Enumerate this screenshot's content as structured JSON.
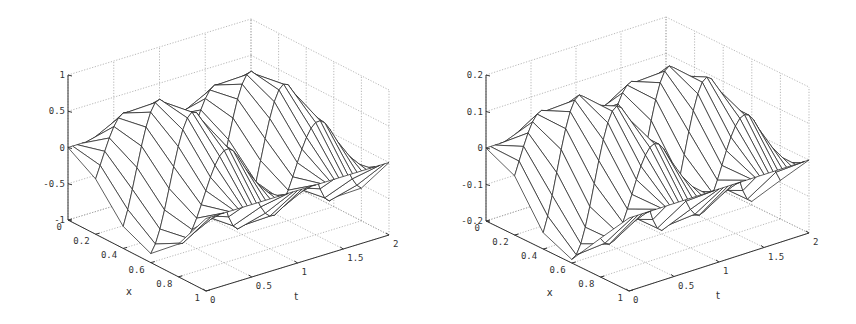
{
  "chart_data": [
    {
      "type": "surface",
      "title": "",
      "xlabel": "x",
      "ylabel": "t",
      "zlabel": "",
      "x_ticks": [
        "0",
        "0.2",
        "0.4",
        "0.6",
        "0.8",
        "1"
      ],
      "t_ticks": [
        "0",
        "0.5",
        "1",
        "1.5",
        "2"
      ],
      "z_ticks": [
        "-1",
        "-0.5",
        "0",
        "0.5",
        "1"
      ],
      "xlim": [
        0,
        1
      ],
      "tlim": [
        0,
        2
      ],
      "zlim": [
        -1,
        1
      ],
      "grid": true,
      "style": "wireframe mesh, black lines on white",
      "function_description": "wave u(x,t) with amplitude ~1, peaks ~0.75-1 and troughs ~-1 along t in [0,2], sinusoidal in x",
      "mesh": {
        "x_lines": 6,
        "t_lines": 41
      },
      "amplitude": 1.0
    },
    {
      "type": "surface",
      "title": "",
      "xlabel": "x",
      "ylabel": "t",
      "zlabel": "",
      "x_ticks": [
        "0",
        "0.2",
        "0.4",
        "0.6",
        "0.8",
        "1"
      ],
      "t_ticks": [
        "0",
        "0.5",
        "1",
        "1.5",
        "2"
      ],
      "z_ticks": [
        "-0.2",
        "-0.1",
        "0",
        "0.1",
        "0.2"
      ],
      "xlim": [
        0,
        1
      ],
      "tlim": [
        0,
        2
      ],
      "zlim": [
        -0.2,
        0.2
      ],
      "grid": true,
      "style": "wireframe mesh, black lines on white",
      "function_description": "wave u(x,t) with amplitude ~0.2, peaks ~0.12-0.2 and troughs ~-0.2 along t in [0,2], sinusoidal in x",
      "mesh": {
        "x_lines": 6,
        "t_lines": 41
      },
      "amplitude": 0.2
    }
  ],
  "plots": [
    {
      "xlabel": "x",
      "tlabel": "t"
    },
    {
      "xlabel": "x",
      "tlabel": "t"
    }
  ]
}
